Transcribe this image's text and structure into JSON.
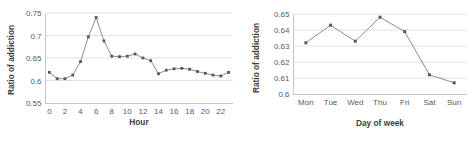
{
  "charts": [
    {
      "id": "hour",
      "ylabel": "Ratio of addiction",
      "xlabel": "Hour"
    },
    {
      "id": "dow",
      "ylabel": "Ratio of addiction",
      "xlabel": "Day of week"
    }
  ],
  "chart_data": [
    {
      "type": "line",
      "title": "",
      "xlabel": "Hour",
      "ylabel": "Ratio of addiction",
      "x": [
        0,
        1,
        2,
        3,
        4,
        5,
        6,
        7,
        8,
        9,
        10,
        11,
        12,
        13,
        14,
        15,
        16,
        17,
        18,
        19,
        20,
        21,
        22,
        23
      ],
      "values": [
        0.618,
        0.604,
        0.604,
        0.612,
        0.642,
        0.697,
        0.74,
        0.688,
        0.654,
        0.653,
        0.654,
        0.659,
        0.65,
        0.644,
        0.615,
        0.623,
        0.626,
        0.627,
        0.625,
        0.62,
        0.616,
        0.612,
        0.61,
        0.618
      ],
      "xlim": [
        -0.5,
        23.5
      ],
      "ylim": [
        0.55,
        0.75
      ],
      "xticks": [
        0,
        2,
        4,
        6,
        8,
        10,
        12,
        14,
        16,
        18,
        20,
        22
      ],
      "xticklabels": [
        "0",
        "2",
        "4",
        "6",
        "8",
        "10",
        "12",
        "14",
        "16",
        "18",
        "20",
        "22"
      ],
      "yticks": [
        0.55,
        0.6,
        0.65,
        0.7,
        0.75
      ],
      "yticklabels": [
        "0.55",
        "0.6",
        "0.65",
        "0.7",
        "0.75"
      ],
      "grid": "horizontal",
      "legend": "none",
      "marker": "square",
      "line_color": "#808080",
      "marker_color": "#595959"
    },
    {
      "type": "line",
      "title": "",
      "xlabel": "Day of week",
      "ylabel": "Ratio of addiction",
      "categories": [
        "Mon",
        "Tue",
        "Wed",
        "Thu",
        "Fri",
        "Sat",
        "Sun"
      ],
      "values": [
        0.632,
        0.643,
        0.633,
        0.648,
        0.639,
        0.612,
        0.607
      ],
      "ylim": [
        0.6,
        0.65
      ],
      "yticks": [
        0.6,
        0.61,
        0.62,
        0.63,
        0.64,
        0.65
      ],
      "yticklabels": [
        "0.6",
        "0.61",
        "0.62",
        "0.63",
        "0.64",
        "0.65"
      ],
      "xticklabels": [
        "Mon",
        "Tue",
        "Wed",
        "Thu",
        "Fri",
        "Sat",
        "Sun"
      ],
      "grid": "horizontal",
      "legend": "none",
      "marker": "square",
      "line_color": "#808080",
      "marker_color": "#595959"
    }
  ]
}
